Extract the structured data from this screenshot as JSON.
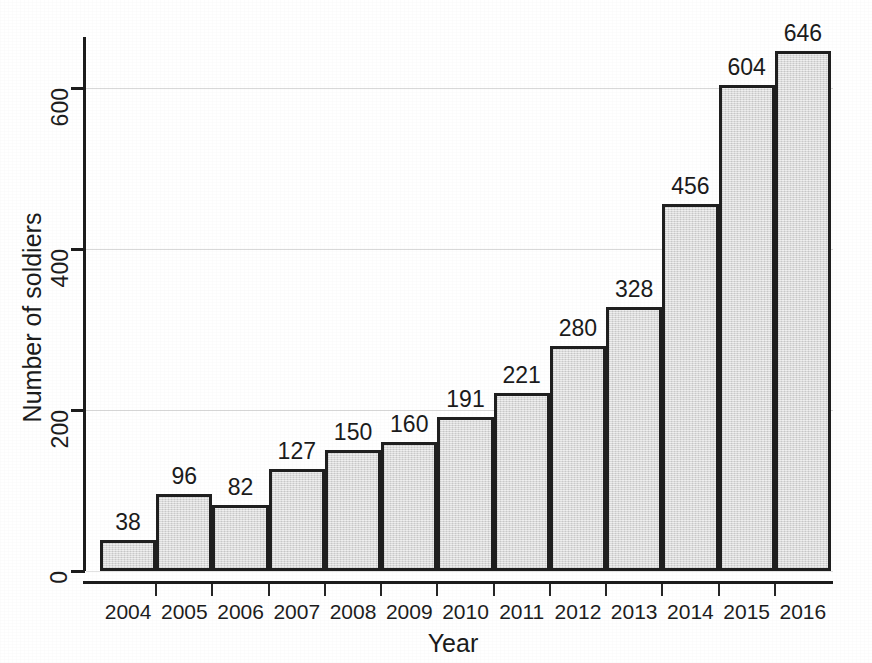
{
  "chart_data": {
    "type": "bar",
    "title": "",
    "xlabel": "Year",
    "ylabel": "Number of soldiers",
    "categories": [
      "2004",
      "2005",
      "2006",
      "2007",
      "2008",
      "2009",
      "2010",
      "2011",
      "2012",
      "2013",
      "2014",
      "2015",
      "2016"
    ],
    "values": [
      38,
      96,
      82,
      127,
      150,
      160,
      191,
      221,
      280,
      328,
      456,
      604,
      646
    ],
    "value_labels": [
      "38",
      "96",
      "82",
      "127",
      "150",
      "160",
      "191",
      "221",
      "280",
      "328",
      "456",
      "604",
      "646"
    ],
    "ylim": [
      0,
      665
    ],
    "yticks": [
      0,
      200,
      400,
      600
    ],
    "ytick_labels": [
      "0",
      "200",
      "400",
      "600"
    ],
    "grid": "horizontal",
    "legend": "none",
    "bar_fill_color": "#dddddd",
    "bar_edge_color": "#1f1f1f",
    "gridline_color": "#d8d8d8",
    "axis_color": "#1c1c1c",
    "background_color": "#ffffff"
  }
}
